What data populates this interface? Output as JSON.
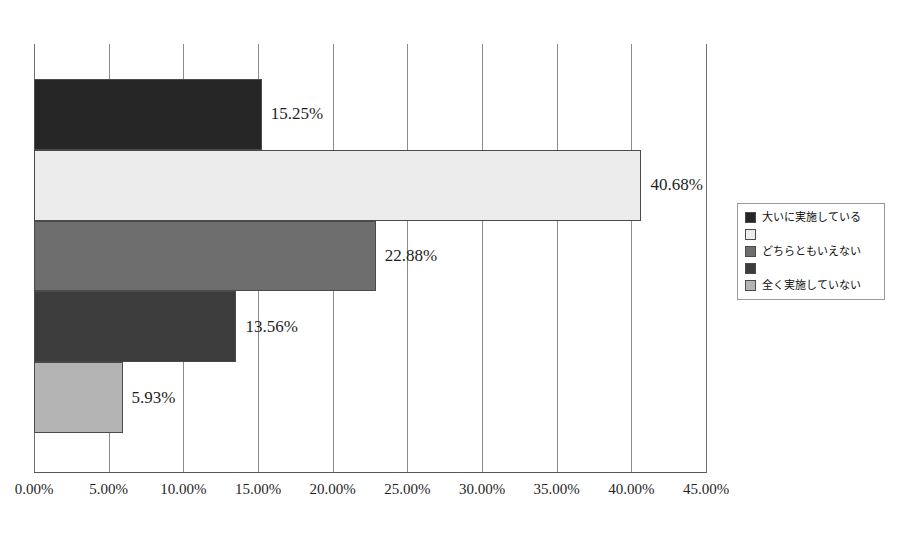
{
  "chart_data": {
    "type": "bar",
    "orientation": "horizontal",
    "title": "",
    "subtitle": "",
    "xlabel": "",
    "ylabel": "",
    "xlim": [
      0,
      45
    ],
    "xtick_step": 5,
    "grid": true,
    "legend_position": "right",
    "categories": [
      "大いに実施している",
      "",
      "どちらともいえない",
      "",
      "全く実施していない"
    ],
    "values": [
      15.25,
      40.68,
      22.88,
      13.56,
      5.93
    ],
    "value_labels": [
      "15.25%",
      "40.68%",
      "22.88%",
      "13.56%",
      "5.93%"
    ],
    "colors": [
      "#262626",
      "#ececec",
      "#6e6e6e",
      "#3c3c3c",
      "#b4b4b4"
    ],
    "tick_labels": [
      "0.00%",
      "5.00%",
      "10.00%",
      "15.00%",
      "20.00%",
      "25.00%",
      "30.00%",
      "35.00%",
      "40.00%",
      "45.00%"
    ],
    "tick_values": [
      0,
      5,
      10,
      15,
      20,
      25,
      30,
      35,
      40,
      45
    ]
  },
  "legend": {
    "items": [
      {
        "label": "大いに実施している",
        "color": "#262626"
      },
      {
        "label": "",
        "color": "#ececec"
      },
      {
        "label": "どちらともいえない",
        "color": "#6e6e6e"
      },
      {
        "label": "",
        "color": "#3c3c3c"
      },
      {
        "label": "全く実施していない",
        "color": "#b4b4b4"
      }
    ]
  }
}
